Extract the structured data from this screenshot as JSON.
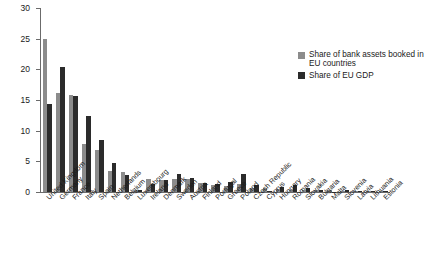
{
  "chart_data": {
    "type": "bar",
    "title": "",
    "subtitle": "",
    "xlabel": "",
    "ylabel": "",
    "ylim": [
      0,
      30
    ],
    "yticks": [
      0,
      5,
      10,
      15,
      20,
      25,
      30
    ],
    "ytick_labels": [
      "0",
      "5",
      "10",
      "15",
      "20",
      "25",
      "30"
    ],
    "grid": false,
    "legend_position": "upper right",
    "categories": [
      "United Kingdom",
      "Germany",
      "France",
      "Italy",
      "Spain",
      "Netherlands",
      "Belgium",
      "Luxembourg",
      "Ireland",
      "Denmark",
      "Sweden",
      "Austria",
      "Finland",
      "Portugal",
      "Greece",
      "Poland",
      "Czech Republic",
      "Cyprus",
      "Hungary",
      "Romania",
      "Slovakia",
      "Bulgaria",
      "Malta",
      "Slovenia",
      "Latvia",
      "Lithuania",
      "Estonia"
    ],
    "series": [
      {
        "name": "Share of bank assets booked in EU countries",
        "color": "#8c8c8c",
        "values": [
          25.0,
          16.2,
          15.8,
          7.9,
          6.8,
          3.4,
          3.2,
          0.3,
          2.2,
          1.9,
          2.1,
          2.2,
          1.4,
          1.2,
          0.9,
          1.3,
          0.7,
          0.7,
          0.5,
          0.4,
          0.4,
          0.3,
          0.3,
          0.2,
          0.15,
          0.15,
          0.1
        ]
      },
      {
        "name": "Share of EU GDP",
        "color": "#2b2b2b",
        "values": [
          14.3,
          20.4,
          15.7,
          12.4,
          8.4,
          4.7,
          2.8,
          0.3,
          1.3,
          1.9,
          2.9,
          2.3,
          1.4,
          1.3,
          1.6,
          2.9,
          1.1,
          0.15,
          0.8,
          1.1,
          0.6,
          0.3,
          0.05,
          0.3,
          0.15,
          0.2,
          0.1
        ]
      }
    ],
    "legend": [
      {
        "label": "Share of bank assets booked in EU countries",
        "color": "#8c8c8c"
      },
      {
        "label": "Share of EU GDP",
        "color": "#2b2b2b"
      }
    ]
  }
}
